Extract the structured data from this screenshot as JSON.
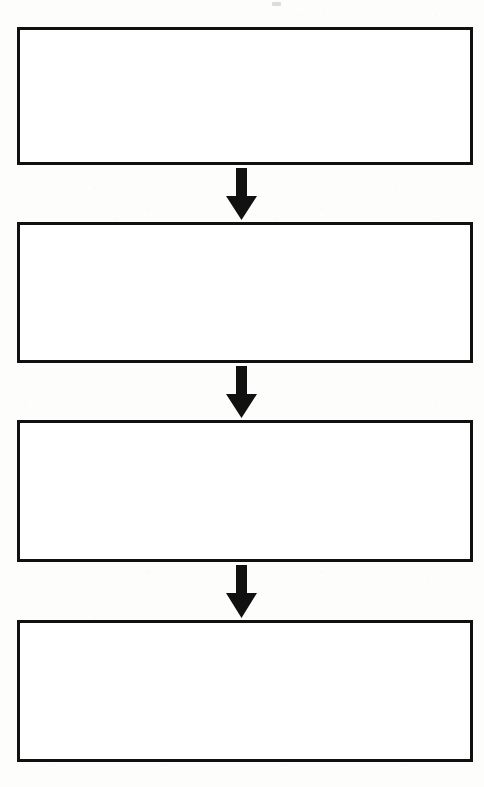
{
  "document": {
    "type": "flowchart",
    "orientation": "vertical",
    "title": "",
    "description": "Blank four-step vertical flowchart: four empty rectangular process boxes connected top-to-bottom by three solid downward arrows.",
    "page": {
      "width": 484,
      "height": 787,
      "background_color": "#fdfdfc"
    },
    "style": {
      "box_border_color": "#111111",
      "box_border_width": 3,
      "box_fill_color": "#ffffff",
      "arrow_color": "#111111"
    }
  },
  "boxes": [
    {
      "id": "box-1",
      "index": 1,
      "label": "",
      "x": 17,
      "y": 27,
      "width": 456,
      "height": 138,
      "border_width": 3
    },
    {
      "id": "box-2",
      "index": 2,
      "label": "",
      "x": 17,
      "y": 222,
      "width": 456,
      "height": 141,
      "border_width": 3
    },
    {
      "id": "box-3",
      "index": 3,
      "label": "",
      "x": 17,
      "y": 420,
      "width": 456,
      "height": 142,
      "border_width": 3
    },
    {
      "id": "box-4",
      "index": 4,
      "label": "",
      "x": 17,
      "y": 620,
      "width": 456,
      "height": 142,
      "border_width": 3
    }
  ],
  "arrows": [
    {
      "id": "arrow-1",
      "from": "box-1",
      "to": "box-2",
      "direction": "down",
      "label": "",
      "x": 226,
      "y": 168,
      "width": 31,
      "height": 52,
      "shaft_width": 11,
      "head_width": 31,
      "head_height": 24
    },
    {
      "id": "arrow-2",
      "from": "box-2",
      "to": "box-3",
      "direction": "down",
      "label": "",
      "x": 226,
      "y": 366,
      "width": 31,
      "height": 52,
      "shaft_width": 11,
      "head_width": 31,
      "head_height": 24
    },
    {
      "id": "arrow-3",
      "from": "box-3",
      "to": "box-4",
      "direction": "down",
      "label": "",
      "x": 226,
      "y": 565,
      "width": 31,
      "height": 53,
      "shaft_width": 11,
      "head_width": 31,
      "head_height": 25
    }
  ]
}
